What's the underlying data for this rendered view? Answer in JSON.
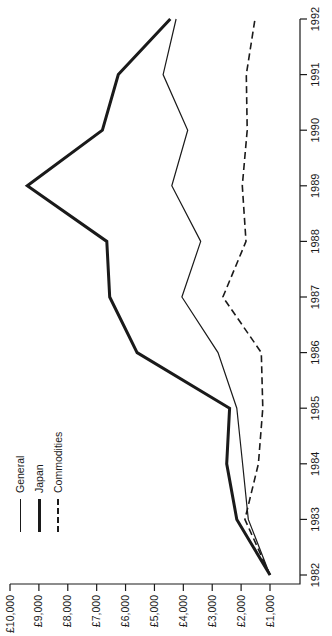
{
  "page": {
    "background": "#ffffff",
    "ink_color": "#1a1a1a"
  },
  "chart_data": {
    "type": "line",
    "title": "",
    "xlabel": "",
    "ylabel": "",
    "rotation_deg": -90,
    "grid": false,
    "x": [
      1982,
      1983,
      1984,
      1985,
      1986,
      1987,
      1988,
      1989,
      1990,
      1991,
      1992
    ],
    "x_tick_labels": [
      "1982",
      "1983",
      "1984",
      "1985",
      "1986",
      "1987",
      "1988",
      "1989",
      "1990",
      "1991",
      "1992"
    ],
    "xlim": [
      1982,
      1992
    ],
    "y_tick_values": [
      1000,
      2000,
      3000,
      4000,
      5000,
      6000,
      7000,
      8000,
      9000,
      10000
    ],
    "y_tick_labels": [
      "£1,000",
      "£2,000",
      "£3,000",
      "£4,000",
      "£5,000",
      "£6,000",
      "£7,000",
      "£8,000",
      "£9,000",
      "£10,000"
    ],
    "ylim": [
      1000,
      10000
    ],
    "series": [
      {
        "name": "General",
        "style": "solid",
        "stroke_width": 1.2,
        "values": [
          1000,
          1750,
          1950,
          2150,
          2800,
          4050,
          3400,
          4400,
          3850,
          4700,
          4250
        ]
      },
      {
        "name": "Japan",
        "style": "solid",
        "stroke_width": 3,
        "values": [
          1000,
          2150,
          2500,
          2400,
          5600,
          6550,
          6650,
          9400,
          6800,
          6250,
          4450
        ]
      },
      {
        "name": "Commodities",
        "style": "dashed",
        "stroke_width": 1.6,
        "values": [
          1000,
          1870,
          1400,
          1250,
          1300,
          2630,
          1830,
          1960,
          1790,
          1820,
          1520
        ]
      }
    ],
    "legend": {
      "position": "top-left-inside"
    },
    "line_color": "#1a1a1a"
  }
}
